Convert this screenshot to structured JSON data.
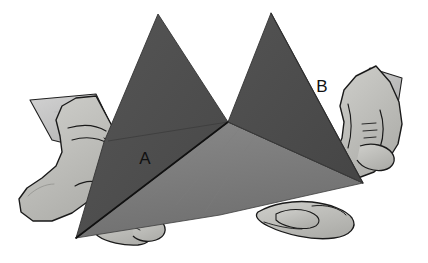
{
  "figure": {
    "labels": [
      {
        "id": "label-a",
        "text": "A",
        "x": 145,
        "y": 164
      },
      {
        "id": "label-b",
        "text": "B",
        "x": 322,
        "y": 92
      }
    ],
    "colors": {
      "background": "#ffffff",
      "peak_face_dark": "#4c4c4c",
      "peak_face_dark_alt": "#4f4f4f",
      "base_face_mid": "#767676",
      "base_face_light": "#8a8a8a",
      "lower_left_face": "#707070",
      "paper_flap": "#c8c8c8",
      "paper_flap_shade": "#b4b4b4",
      "skin": "#c4c4c0",
      "skin_shadow": "#a9a9a5",
      "skin_highlight": "#d2d2ce",
      "outline": "#1a1a1a",
      "label_text": "#111111"
    },
    "parts": [
      {
        "name": "left-peak",
        "label": "left triangular peak"
      },
      {
        "name": "right-peak",
        "label": "right triangular peak"
      },
      {
        "name": "base-panel",
        "label": "base panel"
      },
      {
        "name": "fold-edge-a",
        "label": "fold edge A"
      },
      {
        "name": "fold-edge-b",
        "label": "fold edge B"
      },
      {
        "name": "left-hand",
        "label": "left hand"
      },
      {
        "name": "right-hand",
        "label": "right hand"
      },
      {
        "name": "left-paper-flap",
        "label": "left paper flap"
      },
      {
        "name": "right-paper-flap",
        "label": "right paper flap"
      }
    ]
  }
}
